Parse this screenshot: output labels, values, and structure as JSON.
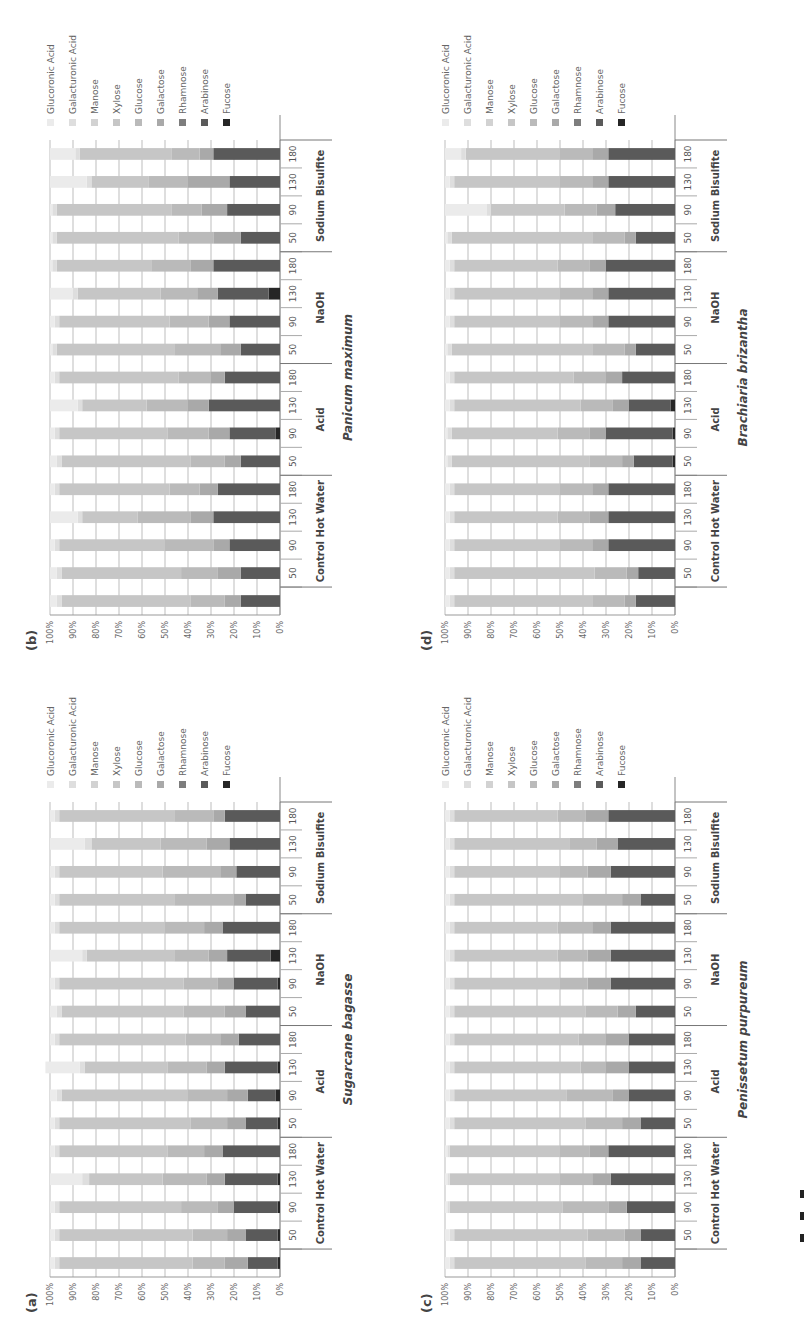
{
  "figure": {
    "panels_order": [
      "b",
      "a",
      "d",
      "c"
    ]
  },
  "legend": [
    {
      "name": "Glucoronic Acid",
      "color": "#ebebeb"
    },
    {
      "name": "Galacturonic Acid",
      "color": "#dedede"
    },
    {
      "name": "Manose",
      "color": "#d2d2d2"
    },
    {
      "name": "Xylose",
      "color": "#c6c6c6"
    },
    {
      "name": "Glucose",
      "color": "#bababa"
    },
    {
      "name": "Galactose",
      "color": "#a9a9a9"
    },
    {
      "name": "Rhamnose",
      "color": "#7d7d7d"
    },
    {
      "name": "Arabinose",
      "color": "#5a5a5a"
    },
    {
      "name": "Fucose",
      "color": "#262626"
    }
  ],
  "axis": {
    "ticks": [
      "0%",
      "10%",
      "20%",
      "30%",
      "40%",
      "50%",
      "60%",
      "70%",
      "80%",
      "90%",
      "100%"
    ]
  },
  "groups": [
    {
      "label": "Control Hot Water",
      "temps": [
        "50",
        "90",
        "130",
        "180"
      ]
    },
    {
      "label": "Acid",
      "temps": [
        "50",
        "90",
        "130",
        "180"
      ]
    },
    {
      "label": "NaOH",
      "temps": [
        "50",
        "90",
        "130",
        "180"
      ]
    },
    {
      "label": "Sodium Bisulfite",
      "temps": [
        "50",
        "90",
        "130",
        "180"
      ]
    }
  ],
  "chart_data": [
    {
      "panel": "(a)",
      "title": "Sugarcane bagasse",
      "type": "bar",
      "stacked": true,
      "orientation": "vertical (figure rotated 90° on page)",
      "categories": [
        "Control",
        "CHW 50",
        "CHW 90",
        "CHW 130",
        "CHW 180",
        "Acid 50",
        "Acid 90",
        "Acid 130",
        "Acid 180",
        "NaOH 50",
        "NaOH 90",
        "NaOH 130",
        "NaOH 180",
        "SB 50",
        "SB 90",
        "SB 130",
        "SB 180"
      ],
      "ylim": [
        0,
        100
      ],
      "ylabel": "",
      "xlabel": "",
      "series": [
        {
          "name": "Fucose",
          "values": [
            1,
            1,
            1,
            1,
            0,
            1,
            2,
            1,
            0,
            0,
            1,
            4,
            0,
            0,
            0,
            0,
            0
          ]
        },
        {
          "name": "Arabinose",
          "values": [
            13,
            14,
            19,
            23,
            25,
            14,
            12,
            23,
            18,
            15,
            19,
            19,
            25,
            15,
            19,
            22,
            24
          ]
        },
        {
          "name": "Rhamnose",
          "values": [
            0,
            0,
            0,
            0,
            0,
            0,
            0,
            0,
            0,
            0,
            0,
            0,
            0,
            0,
            0,
            0,
            0
          ]
        },
        {
          "name": "Galactose",
          "values": [
            10,
            8,
            7,
            8,
            8,
            8,
            9,
            8,
            8,
            9,
            7,
            8,
            8,
            5,
            7,
            10,
            5
          ]
        },
        {
          "name": "Glucose",
          "values": [
            14,
            15,
            16,
            19,
            16,
            16,
            17,
            17,
            15,
            18,
            15,
            15,
            17,
            26,
            25,
            20,
            17
          ]
        },
        {
          "name": "Xylose",
          "values": [
            58,
            58,
            53,
            32,
            47,
            57,
            55,
            36,
            55,
            53,
            54,
            38,
            46,
            50,
            45,
            30,
            50
          ]
        },
        {
          "name": "Manose",
          "values": [
            0,
            0,
            0,
            0,
            0,
            0,
            0,
            0,
            0,
            0,
            0,
            0,
            0,
            0,
            0,
            0,
            0
          ]
        },
        {
          "name": "Galacturonic Acid",
          "values": [
            2,
            2,
            2,
            3,
            2,
            2,
            2,
            2,
            2,
            2,
            2,
            2,
            2,
            2,
            2,
            3,
            2
          ]
        },
        {
          "name": "Glucoronic Acid",
          "values": [
            2,
            2,
            2,
            14,
            2,
            2,
            3,
            15,
            2,
            3,
            2,
            14,
            2,
            2,
            2,
            15,
            2
          ]
        }
      ]
    },
    {
      "panel": "(b)",
      "title": "Panicum maximum",
      "type": "bar",
      "stacked": true,
      "categories": [
        "Control",
        "CHW 50",
        "CHW 90",
        "CHW 130",
        "CHW 180",
        "Acid 50",
        "Acid 90",
        "Acid 130",
        "Acid 180",
        "NaOH 50",
        "NaOH 90",
        "NaOH 130",
        "NaOH 180",
        "SB 50",
        "SB 90",
        "SB 130",
        "SB 180"
      ],
      "ylim": [
        0,
        100
      ],
      "series": [
        {
          "name": "Fucose",
          "values": [
            0,
            0,
            0,
            0,
            0,
            0,
            2,
            0,
            0,
            0,
            0,
            5,
            0,
            0,
            0,
            0,
            0
          ]
        },
        {
          "name": "Arabinose",
          "values": [
            17,
            17,
            22,
            29,
            27,
            17,
            20,
            31,
            24,
            17,
            22,
            22,
            29,
            17,
            23,
            22,
            29
          ]
        },
        {
          "name": "Rhamnose",
          "values": [
            0,
            0,
            0,
            0,
            0,
            0,
            0,
            0,
            0,
            0,
            0,
            0,
            0,
            0,
            0,
            0,
            0
          ]
        },
        {
          "name": "Galactose",
          "values": [
            7,
            10,
            7,
            10,
            8,
            7,
            9,
            9,
            6,
            9,
            9,
            9,
            10,
            12,
            11,
            18,
            6
          ]
        },
        {
          "name": "Glucose",
          "values": [
            15,
            16,
            21,
            23,
            13,
            15,
            18,
            18,
            14,
            20,
            17,
            16,
            17,
            15,
            13,
            17,
            12
          ]
        },
        {
          "name": "Xylose",
          "values": [
            56,
            52,
            46,
            24,
            48,
            56,
            47,
            28,
            52,
            51,
            48,
            36,
            41,
            53,
            50,
            25,
            40
          ]
        },
        {
          "name": "Manose",
          "values": [
            0,
            0,
            0,
            0,
            0,
            0,
            0,
            0,
            0,
            0,
            0,
            0,
            0,
            0,
            0,
            0,
            0
          ]
        },
        {
          "name": "Galacturonic Acid",
          "values": [
            2,
            2,
            2,
            2,
            2,
            2,
            2,
            2,
            2,
            2,
            2,
            2,
            2,
            2,
            2,
            2,
            2
          ]
        },
        {
          "name": "Glucoronic Acid",
          "values": [
            3,
            3,
            2,
            12,
            2,
            3,
            2,
            12,
            2,
            1,
            2,
            10,
            1,
            1,
            1,
            16,
            11
          ]
        }
      ]
    },
    {
      "panel": "(c)",
      "title": "Penissetum purpureum",
      "type": "bar",
      "stacked": true,
      "categories": [
        "Control",
        "CHW 50",
        "CHW 90",
        "CHW 130",
        "CHW 180",
        "Acid 50",
        "Acid 90",
        "Acid 130",
        "Acid 180",
        "NaOH 50",
        "NaOH 90",
        "NaOH 130",
        "NaOH 180",
        "SB 50",
        "SB 90",
        "SB 130",
        "SB 180"
      ],
      "ylim": [
        0,
        100
      ],
      "series": [
        {
          "name": "Fucose",
          "values": [
            0,
            0,
            0,
            0,
            0,
            0,
            0,
            0,
            0,
            0,
            0,
            0,
            0,
            0,
            0,
            0,
            0
          ]
        },
        {
          "name": "Arabinose",
          "values": [
            15,
            15,
            21,
            28,
            29,
            15,
            20,
            20,
            20,
            17,
            28,
            28,
            28,
            15,
            28,
            25,
            29
          ]
        },
        {
          "name": "Rhamnose",
          "values": [
            0,
            0,
            0,
            0,
            0,
            0,
            0,
            0,
            0,
            0,
            0,
            0,
            0,
            0,
            0,
            0,
            0
          ]
        },
        {
          "name": "Galactose",
          "values": [
            8,
            7,
            8,
            8,
            8,
            8,
            7,
            10,
            10,
            8,
            10,
            10,
            8,
            8,
            10,
            9,
            10
          ]
        },
        {
          "name": "Glucose",
          "values": [
            16,
            16,
            20,
            14,
            13,
            16,
            20,
            11,
            12,
            14,
            12,
            13,
            15,
            17,
            12,
            12,
            12
          ]
        },
        {
          "name": "Xylose",
          "values": [
            57,
            58,
            49,
            48,
            48,
            57,
            49,
            55,
            54,
            57,
            46,
            45,
            45,
            56,
            46,
            50,
            45
          ]
        },
        {
          "name": "Manose",
          "values": [
            0,
            0,
            0,
            0,
            0,
            0,
            0,
            0,
            0,
            0,
            0,
            0,
            0,
            0,
            0,
            0,
            0
          ]
        },
        {
          "name": "Galacturonic Acid",
          "values": [
            2,
            2,
            1,
            1,
            1,
            2,
            2,
            2,
            2,
            2,
            2,
            2,
            2,
            2,
            2,
            2,
            2
          ]
        },
        {
          "name": "Glucoronic Acid",
          "values": [
            2,
            2,
            1,
            1,
            1,
            2,
            2,
            2,
            2,
            2,
            2,
            2,
            2,
            2,
            2,
            2,
            2
          ]
        }
      ]
    },
    {
      "panel": "(d)",
      "title": "Brachiaria brizantha",
      "type": "bar",
      "stacked": true,
      "categories": [
        "Control",
        "CHW 50",
        "CHW 90",
        "CHW 130",
        "CHW 180",
        "Acid 50",
        "Acid 90",
        "Acid 130",
        "Acid 180",
        "NaOH 50",
        "NaOH 90",
        "NaOH 130",
        "NaOH 180",
        "SB 50",
        "SB 90",
        "SB 130",
        "SB 180"
      ],
      "ylim": [
        0,
        100
      ],
      "series": [
        {
          "name": "Fucose",
          "values": [
            0,
            0,
            0,
            0,
            0,
            1,
            1,
            2,
            0,
            0,
            0,
            0,
            0,
            0,
            0,
            0,
            0
          ]
        },
        {
          "name": "Arabinose",
          "values": [
            17,
            16,
            29,
            29,
            29,
            17,
            29,
            18,
            23,
            17,
            29,
            29,
            30,
            17,
            26,
            29,
            29
          ]
        },
        {
          "name": "Rhamnose",
          "values": [
            0,
            0,
            0,
            0,
            0,
            0,
            0,
            0,
            0,
            0,
            0,
            0,
            0,
            0,
            0,
            0,
            0
          ]
        },
        {
          "name": "Galactose",
          "values": [
            5,
            5,
            7,
            8,
            7,
            5,
            7,
            7,
            7,
            5,
            7,
            7,
            7,
            5,
            8,
            7,
            7
          ]
        },
        {
          "name": "Glucose",
          "values": [
            14,
            14,
            14,
            14,
            14,
            14,
            14,
            14,
            14,
            14,
            14,
            14,
            14,
            14,
            14,
            14,
            14
          ]
        },
        {
          "name": "Xylose",
          "values": [
            60,
            61,
            46,
            45,
            46,
            60,
            46,
            55,
            52,
            61,
            46,
            46,
            45,
            61,
            32,
            46,
            41
          ]
        },
        {
          "name": "Manose",
          "values": [
            0,
            0,
            0,
            0,
            0,
            0,
            0,
            0,
            0,
            0,
            0,
            0,
            0,
            0,
            0,
            0,
            0
          ]
        },
        {
          "name": "Galacturonic Acid",
          "values": [
            2,
            2,
            2,
            2,
            2,
            2,
            2,
            2,
            2,
            2,
            2,
            2,
            2,
            2,
            2,
            2,
            2
          ]
        },
        {
          "name": "Glucoronic Acid",
          "values": [
            2,
            2,
            2,
            2,
            2,
            1,
            1,
            2,
            2,
            1,
            2,
            2,
            2,
            1,
            18,
            2,
            7
          ]
        }
      ]
    }
  ]
}
